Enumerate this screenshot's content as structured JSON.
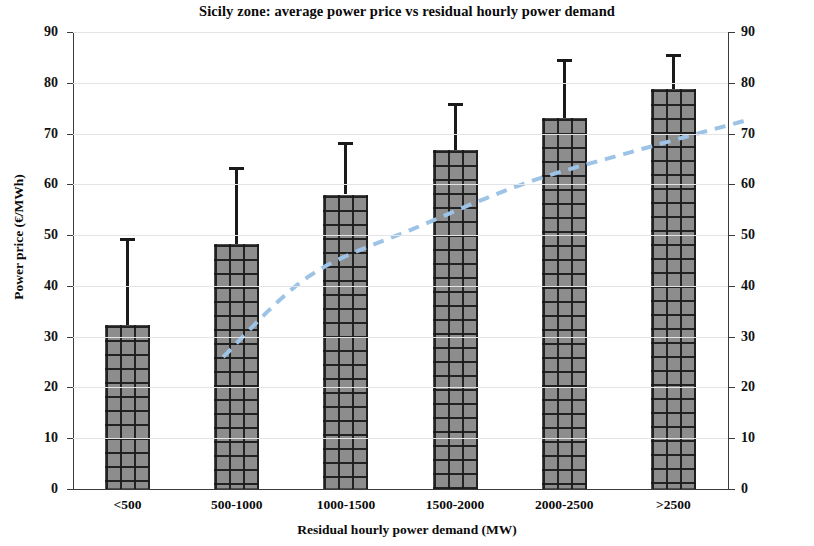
{
  "chart_data": {
    "type": "bar",
    "title": "Sicily zone: average power price vs residual hourly power demand",
    "xlabel": "Residual hourly power demand  (MW)",
    "ylabel": "Power price (€/MWh)",
    "categories": [
      "<500",
      "500-1000",
      "1000-1500",
      "1500-2000",
      "2000-2500",
      ">2500"
    ],
    "values": [
      32.3,
      48.3,
      58.0,
      66.7,
      73.0,
      78.8
    ],
    "error_upper": [
      49.5,
      63.5,
      68.3,
      76.0,
      84.7,
      85.7
    ],
    "series": [
      {
        "name": "Average power price",
        "type": "bar",
        "values": [
          32.3,
          48.3,
          58.0,
          66.7,
          73.0,
          78.8
        ]
      },
      {
        "name": "Trend",
        "type": "line",
        "style": "dashed",
        "color": "#9dc3e6",
        "values": [
          32.3,
          48.3,
          58.0,
          66.7,
          73.0,
          78.8
        ]
      }
    ],
    "ylim": [
      0,
      90
    ],
    "yticks": [
      0,
      10,
      20,
      30,
      40,
      50,
      60,
      70,
      80,
      90
    ],
    "ytick_labels": [
      "0",
      "10",
      "20",
      "30",
      "40",
      "50",
      "60",
      "70",
      "80",
      "90"
    ],
    "secondary_yaxis": {
      "ylim": [
        0,
        90
      ],
      "yticks": [
        0,
        10,
        20,
        30,
        40,
        50,
        60,
        70,
        80,
        90
      ],
      "ytick_labels": [
        "0",
        "10",
        "20",
        "30",
        "40",
        "50",
        "60",
        "70",
        "80",
        "90"
      ]
    },
    "grid": true,
    "grid_axis": "y",
    "legend": "none",
    "bar_color": "#8d8d8d",
    "bar_pattern": "crosshatch-grid",
    "errorbar_color": "#1a1a1a",
    "gridline_color": "#e3e3e8",
    "axis_color": "#3b3b3b",
    "background": "#ffffff"
  },
  "axis": {
    "y_title": "Power price (€/MWh)",
    "x_title": "Residual hourly power demand  (MW)"
  },
  "title": "Sicily zone: average power price vs residual hourly power demand"
}
